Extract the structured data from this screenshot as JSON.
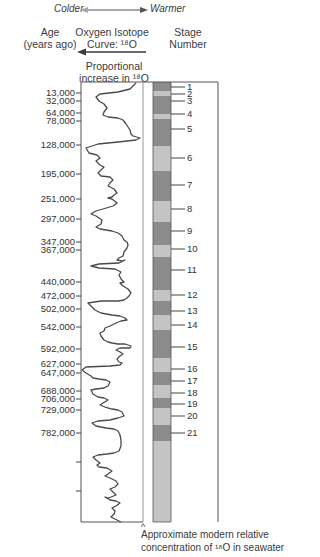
{
  "header": {
    "scale_left": "Colder",
    "scale_right": "Warmer",
    "age_title_line1": "Age",
    "age_title_line2": "(years ago)",
    "curve_title_line1": "Oxygen Isotope",
    "curve_title_line2": "Curve: ¹⁸O",
    "stage_title_line1": "Stage",
    "stage_title_line2": "Number",
    "arrow_caption_line1": "Proportional",
    "arrow_caption_line2": "increase in ¹⁸O"
  },
  "ages": [
    "13,000",
    "32,000",
    "64,000",
    "78,000",
    "128,000",
    "195,000",
    "251,000",
    "297,000",
    "347,000",
    "367,000",
    "440,000",
    "472,000",
    "502,000",
    "542,000",
    "592,000",
    "627,000",
    "647,000",
    "688,000",
    "706,000",
    "729,000",
    "782,000"
  ],
  "stages": [
    "1",
    "2",
    "3",
    "4",
    "5",
    "6",
    "7",
    "8",
    "9",
    "10",
    "11",
    "12",
    "13",
    "14",
    "15",
    "16",
    "17",
    "18",
    "19",
    "20",
    "21"
  ],
  "footer": {
    "caret": "^",
    "caption_line1": "Approximate modern relative",
    "caption_line2": "concentration of ¹⁸O in seawater"
  },
  "colors": {
    "cold_band": "#8c8c8c",
    "warm_band": "#c4c4c4",
    "curve": "#4a4a4a",
    "frame": "#555555",
    "arrow_light": "#a8a8a8"
  },
  "chart_data": {
    "type": "line",
    "title": "Oxygen Isotope Curve: ¹⁸O",
    "xlabel": "Proportional increase in ¹⁸O",
    "ylabel": "Age (years ago)",
    "y_ticks": [
      13000,
      32000,
      64000,
      78000,
      128000,
      195000,
      251000,
      297000,
      347000,
      367000,
      440000,
      472000,
      502000,
      542000,
      592000,
      627000,
      647000,
      688000,
      706000,
      729000,
      782000
    ],
    "stage_bands": [
      {
        "stage": "1",
        "type": "cold"
      },
      {
        "stage": "2",
        "type": "warm"
      },
      {
        "stage": "3",
        "type": "cold"
      },
      {
        "stage": "4",
        "type": "warm"
      },
      {
        "stage": "5",
        "type": "cold"
      },
      {
        "stage": "6",
        "type": "warm"
      },
      {
        "stage": "7",
        "type": "cold"
      },
      {
        "stage": "8",
        "type": "warm"
      },
      {
        "stage": "9",
        "type": "cold"
      },
      {
        "stage": "10",
        "type": "warm"
      },
      {
        "stage": "11",
        "type": "cold"
      },
      {
        "stage": "12",
        "type": "warm"
      },
      {
        "stage": "13",
        "type": "cold"
      },
      {
        "stage": "14",
        "type": "warm"
      },
      {
        "stage": "15",
        "type": "cold"
      },
      {
        "stage": "16",
        "type": "warm"
      },
      {
        "stage": "17",
        "type": "cold"
      },
      {
        "stage": "18",
        "type": "warm"
      },
      {
        "stage": "19",
        "type": "cold"
      },
      {
        "stage": "20",
        "type": "warm"
      },
      {
        "stage": "21",
        "type": "cold"
      }
    ]
  }
}
